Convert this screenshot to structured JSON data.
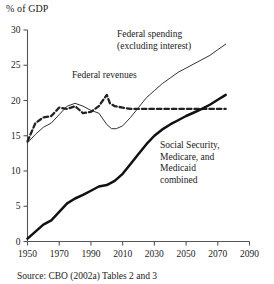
{
  "figure": {
    "y_unit_label": "% of GDP",
    "source_note": "Source: CBO (2002a) Tables 2 and 3"
  },
  "annotations": {
    "spending_line1": "Federal spending",
    "spending_line2": "(excluding interest)",
    "revenues": "Federal revenues",
    "ssmm_line1": "Social Security,",
    "ssmm_line2": "Medicare, and",
    "ssmm_line3": "Medicaid",
    "ssmm_line4": "combined"
  },
  "axes": {
    "y_ticks": [
      "0",
      "5",
      "10",
      "15",
      "20",
      "25",
      "30"
    ],
    "x_ticks": [
      "1950",
      "1970",
      "1990",
      "2010",
      "2030",
      "2050",
      "2070",
      "2090"
    ]
  },
  "colors": {
    "ink": "#1a1a1a",
    "axis": "#555555",
    "spending": "#333333",
    "revenues": "#222222",
    "ssmm": "#111111",
    "background": "#ffffff"
  },
  "chart_data": {
    "type": "line",
    "title": "",
    "xlabel": "",
    "ylabel": "% of GDP",
    "xlim": [
      1950,
      2090
    ],
    "ylim": [
      0,
      30
    ],
    "grid": false,
    "legend": "inline-annotations",
    "source": "Source: CBO (2002a) Tables 2 and 3",
    "series": [
      {
        "name": "Federal spending (excluding interest)",
        "style": "thin-solid",
        "x": [
          1950,
          1955,
          1960,
          1965,
          1970,
          1975,
          1980,
          1985,
          1990,
          1995,
          2000,
          2003,
          2006,
          2010,
          2015,
          2020,
          2025,
          2030,
          2035,
          2040,
          2045,
          2050,
          2055,
          2060,
          2065,
          2070,
          2075
        ],
        "y": [
          14.0,
          15.2,
          16.2,
          16.8,
          18.0,
          19.2,
          19.6,
          19.2,
          18.6,
          18.2,
          16.6,
          16.0,
          16.0,
          16.4,
          17.6,
          19.0,
          20.4,
          21.4,
          22.4,
          23.2,
          24.0,
          24.6,
          25.2,
          25.8,
          26.4,
          27.2,
          28.0
        ]
      },
      {
        "name": "Federal revenues",
        "style": "thick-dashed",
        "x": [
          1950,
          1955,
          1960,
          1965,
          1970,
          1975,
          1980,
          1985,
          1990,
          1995,
          2000,
          2002,
          2005,
          2010,
          2015,
          2020,
          2030,
          2040,
          2050,
          2060,
          2070,
          2075
        ],
        "y": [
          14.2,
          16.8,
          17.6,
          17.8,
          19.0,
          18.8,
          19.2,
          18.2,
          18.4,
          19.2,
          20.8,
          19.6,
          19.2,
          19.0,
          18.8,
          18.8,
          18.8,
          18.8,
          18.8,
          18.8,
          18.8,
          18.8
        ]
      },
      {
        "name": "Social Security, Medicare, and Medicaid combined",
        "style": "thick-solid",
        "x": [
          1950,
          1955,
          1960,
          1965,
          1970,
          1975,
          1980,
          1985,
          1990,
          1995,
          2000,
          2005,
          2010,
          2015,
          2020,
          2025,
          2030,
          2035,
          2040,
          2045,
          2050,
          2055,
          2060,
          2065,
          2070,
          2075
        ],
        "y": [
          0.4,
          1.4,
          2.4,
          3.0,
          4.2,
          5.4,
          6.1,
          6.6,
          7.2,
          7.8,
          8.0,
          8.6,
          9.6,
          11.0,
          12.4,
          13.8,
          15.0,
          15.9,
          16.6,
          17.2,
          17.8,
          18.3,
          18.8,
          19.4,
          20.1,
          20.8
        ]
      }
    ]
  }
}
